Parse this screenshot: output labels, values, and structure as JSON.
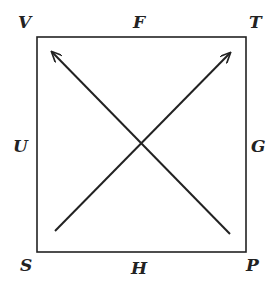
{
  "diagram": {
    "labels": {
      "V": "V",
      "F": "F",
      "T": "T",
      "U": "U",
      "G": "G",
      "S": "S",
      "H": "H",
      "P": "P"
    },
    "shape": "square",
    "arrows": [
      {
        "from": "near S",
        "to": "near T"
      },
      {
        "from": "near P",
        "to": "near V"
      }
    ],
    "stroke_color": "#222222"
  }
}
